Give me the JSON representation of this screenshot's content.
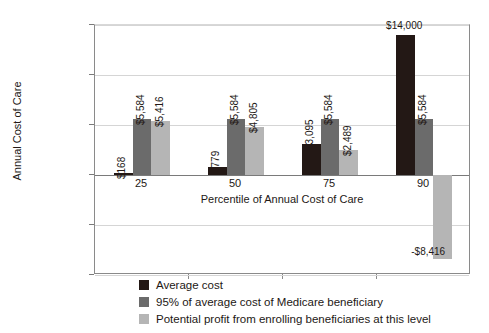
{
  "chart_data": {
    "type": "bar",
    "title": "",
    "xlabel": "Percentile of Annual Cost of Care",
    "ylabel": "Annual Cost of Care",
    "categories": [
      "25",
      "50",
      "75",
      "90"
    ],
    "ylim": [
      -10000,
      15000
    ],
    "ytick_values": [
      15000,
      10000,
      5000,
      0,
      -5000,
      -10000
    ],
    "ytick_labels": [
      "$15,000",
      "$10,000",
      "$5,000",
      "$0",
      "-$5,000",
      "-$10,000"
    ],
    "grid": true,
    "legend_position": "bottom",
    "series": [
      {
        "name": "Average cost",
        "color": "#231815",
        "values": [
          168,
          779,
          3095,
          14000
        ],
        "labels": [
          "$168",
          "$779",
          "$3,095",
          "$14,000"
        ]
      },
      {
        "name": "95% of average cost of Medicare beneficiary",
        "color": "#6b6b6b",
        "values": [
          5584,
          5584,
          5584,
          5584
        ],
        "labels": [
          "$5,584",
          "$5,584",
          "$5,584",
          "$5,584"
        ]
      },
      {
        "name": "Potential profit from enrolling beneficiaries at this level",
        "color": "#b5b5b5",
        "values": [
          5416,
          4805,
          2489,
          -8416
        ],
        "labels": [
          "$5,416",
          "$4,805",
          "$2,489",
          "-$8,416"
        ]
      }
    ]
  }
}
